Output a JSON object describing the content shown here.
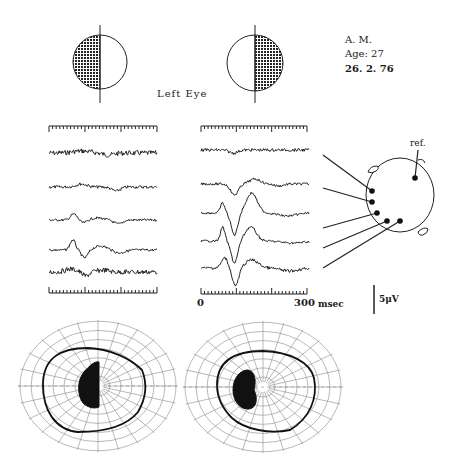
{
  "figure": {
    "subject": {
      "initials": "A. M.",
      "age_label": "Age: 27",
      "date": "26. 2. 76"
    },
    "eye_label": "Left Eye",
    "stimuli": [
      {
        "name": "left-hemifield",
        "shaded_half": "left"
      },
      {
        "name": "right-hemifield",
        "shaded_half": "right"
      }
    ],
    "time_axis": {
      "start_label": "0",
      "end_label": "300",
      "unit": "msec"
    },
    "amplitude_scale": {
      "label": "5μV"
    },
    "head_diagram": {
      "reference_label": "ref.",
      "electrode_count": 5
    },
    "colors": {
      "ink": "#1a1a1a",
      "grid": "#8a8a8a",
      "background": "#ffffff"
    }
  },
  "chart_data": [
    {
      "type": "line",
      "title": "VEP traces — left hemifield stimulation (Left Eye)",
      "xlabel": "time (msec)",
      "xlim": [
        0,
        300
      ],
      "ylabel": "amplitude",
      "scale_bar": "5μV",
      "series": [
        {
          "name": "electrode-1",
          "description": "noisy, flat"
        },
        {
          "name": "electrode-2",
          "description": "small wave, trough ~200 msec"
        },
        {
          "name": "electrode-3",
          "description": "positive peak ~70 msec, trough ~200 msec"
        },
        {
          "name": "electrode-4",
          "description": "large positive peak ~70 msec, negative ~100 msec"
        },
        {
          "name": "electrode-5",
          "description": "noisy, flat"
        }
      ]
    },
    {
      "type": "line",
      "title": "VEP traces — right hemifield stimulation (Left Eye)",
      "xlabel": "time (msec)",
      "xlim": [
        0,
        300
      ],
      "ylabel": "amplitude",
      "scale_bar": "5μV",
      "series": [
        {
          "name": "electrode-1",
          "description": "flat"
        },
        {
          "name": "electrode-2",
          "description": "trough ~100 msec, peak ~160 msec"
        },
        {
          "name": "electrode-3",
          "description": "peak ~70, deep trough ~100, peak ~150 msec"
        },
        {
          "name": "electrode-4",
          "description": "peak ~70, deep trough ~100, peak ~150 msec"
        },
        {
          "name": "electrode-5",
          "description": "peak ~70, trough ~100 msec"
        }
      ]
    },
    {
      "type": "other",
      "title": "Visual field perimetry (two charts)",
      "description": "Polar perimetry charts with thick isopter and black central hemi-scotoma"
    }
  ]
}
